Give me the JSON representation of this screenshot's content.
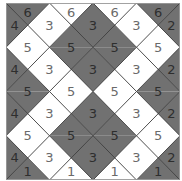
{
  "puzzle": {
    "rows": 4,
    "cols": 4,
    "colors": {
      "dark": "#717171",
      "light": "#ffffff",
      "line": "#3a3a3a"
    },
    "horizontal_edges": [
      [
        {
          "v": "6",
          "s": "d"
        },
        {
          "v": "6",
          "s": "l"
        },
        {
          "v": "6",
          "s": "l"
        },
        {
          "v": "6",
          "s": "d"
        }
      ],
      [
        {
          "v": "5",
          "s": "l"
        },
        {
          "v": "5",
          "s": "d"
        },
        {
          "v": "5",
          "s": "d"
        },
        {
          "v": "5",
          "s": "l"
        }
      ],
      [
        {
          "v": "5",
          "s": "d"
        },
        {
          "v": "5",
          "s": "l"
        },
        {
          "v": "5",
          "s": "l"
        },
        {
          "v": "5",
          "s": "d"
        }
      ],
      [
        {
          "v": "5",
          "s": "l"
        },
        {
          "v": "5",
          "s": "d"
        },
        {
          "v": "5",
          "s": "d"
        },
        {
          "v": "5",
          "s": "l"
        }
      ],
      [
        {
          "v": "1",
          "s": "d"
        },
        {
          "v": "1",
          "s": "l"
        },
        {
          "v": "1",
          "s": "l"
        },
        {
          "v": "1",
          "s": "d"
        }
      ]
    ],
    "vertical_edges": [
      [
        {
          "v": "4",
          "s": "d"
        },
        {
          "v": "3",
          "s": "l"
        },
        {
          "v": "3",
          "s": "d"
        },
        {
          "v": "3",
          "s": "l"
        },
        {
          "v": "2",
          "s": "d"
        }
      ],
      [
        {
          "v": "4",
          "s": "d"
        },
        {
          "v": "3",
          "s": "l"
        },
        {
          "v": "3",
          "s": "d"
        },
        {
          "v": "3",
          "s": "l"
        },
        {
          "v": "2",
          "s": "d"
        }
      ],
      [
        {
          "v": "4",
          "s": "d"
        },
        {
          "v": "3",
          "s": "l"
        },
        {
          "v": "3",
          "s": "d"
        },
        {
          "v": "3",
          "s": "l"
        },
        {
          "v": "2",
          "s": "d"
        }
      ],
      [
        {
          "v": "4",
          "s": "d"
        },
        {
          "v": "3",
          "s": "l"
        },
        {
          "v": "3",
          "s": "d"
        },
        {
          "v": "3",
          "s": "l"
        },
        {
          "v": "2",
          "s": "d"
        }
      ]
    ]
  }
}
